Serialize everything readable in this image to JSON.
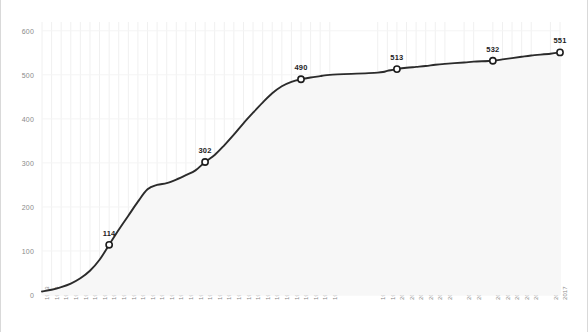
{
  "chart_data": {
    "type": "line",
    "title": "",
    "subtitle": "",
    "xlabel": "",
    "ylabel": "",
    "xlim": [
      1963,
      2017
    ],
    "ylim": [
      0,
      620
    ],
    "yticks": [
      0,
      100,
      200,
      300,
      400,
      500,
      600
    ],
    "grid": "vertical-faint",
    "legend": "none",
    "line_color": "#2b2b2b",
    "marker_fill": "#ffffff",
    "marker_stroke": "#1d1d1d",
    "area_fill": "#f7f7f7",
    "grid_color": "#f0f0f0",
    "tick_color": "#8a8a8a",
    "categories": [
      "1963",
      "1964",
      "1965",
      "1966",
      "1967",
      "1968",
      "1969",
      "1970",
      "1971",
      "1972",
      "1973",
      "1974",
      "1975",
      "1976",
      "1977",
      "1978",
      "1979",
      "1980",
      "1981",
      "1982",
      "1983",
      "1984",
      "1985",
      "1986",
      "1987",
      "1988",
      "1989",
      "1990",
      "1991",
      "1992",
      "1993",
      "1998",
      "1999",
      "2000",
      "2001",
      "2002",
      "2003",
      "2004",
      "2005",
      "2007",
      "2008",
      "2010",
      "2011",
      "2012",
      "2013",
      "2014",
      "2016",
      "2017"
    ],
    "x": [
      1963,
      1964,
      1965,
      1966,
      1967,
      1968,
      1969,
      1970,
      1971,
      1972,
      1973,
      1974,
      1975,
      1976,
      1977,
      1978,
      1979,
      1980,
      1981,
      1982,
      1983,
      1984,
      1985,
      1986,
      1987,
      1988,
      1989,
      1990,
      1991,
      1992,
      1993,
      1998,
      1999,
      2000,
      2001,
      2002,
      2003,
      2004,
      2005,
      2007,
      2008,
      2010,
      2011,
      2012,
      2013,
      2014,
      2016,
      2017
    ],
    "values": [
      8,
      12,
      18,
      26,
      38,
      55,
      80,
      114,
      148,
      180,
      212,
      240,
      250,
      254,
      262,
      272,
      283,
      302,
      318,
      340,
      364,
      390,
      414,
      437,
      458,
      474,
      484,
      490,
      494,
      497,
      500,
      505,
      509,
      513,
      516,
      518,
      520,
      523,
      525,
      528,
      530,
      532,
      535,
      538,
      541,
      544,
      548,
      551
    ],
    "annotated_points": [
      {
        "year": 1970,
        "value": 114,
        "label": "114"
      },
      {
        "year": 1980,
        "value": 302,
        "label": "302"
      },
      {
        "year": 1990,
        "value": 490,
        "label": "490"
      },
      {
        "year": 2000,
        "value": 513,
        "label": "513"
      },
      {
        "year": 2010,
        "value": 532,
        "label": "532"
      },
      {
        "year": 2017,
        "value": 551,
        "label": "551"
      }
    ]
  }
}
